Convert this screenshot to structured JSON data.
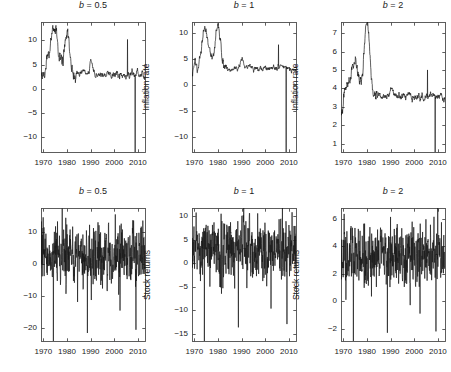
{
  "figure": {
    "background_color": "#ffffff",
    "axis_color": "#4d4d4d",
    "line_color": "#1a1a1a",
    "width": 451,
    "height": 372,
    "rows": 2,
    "cols": 3
  },
  "chart_data": [
    {
      "type": "line",
      "title": "b = 0.5",
      "title_symbol": "b",
      "title_value": "0.5",
      "xlabel": "",
      "ylabel": "Inflation rate",
      "xlim": [
        1969.0,
        2013.0
      ],
      "ylim": [
        -13.0,
        13.8
      ],
      "xticks": [
        1970,
        1980,
        1990,
        2000,
        2010
      ],
      "xtick_labels": [
        "1970",
        "1980",
        "1990",
        "2000",
        "2010"
      ],
      "yticks": [
        -10,
        -5,
        0,
        5,
        10
      ],
      "ytick_labels": [
        "−10",
        "−5",
        "0",
        "5",
        "10"
      ],
      "grid": false,
      "legend": "none",
      "seed": 11,
      "series_shape": "inflation",
      "baseline": 3.0,
      "noise": 0.85,
      "peak1": {
        "year": 1974.6,
        "height": 12.2
      },
      "peak2": {
        "year": 1980.0,
        "height": 11.9
      },
      "spike_up": {
        "year": 2005.6,
        "height": 10.2
      },
      "spike_down": {
        "year": 2008.8,
        "height": -13.0
      },
      "values_note": "monthly inflation rate series, 1969-2013"
    },
    {
      "type": "line",
      "title": "b = 1",
      "title_symbol": "b",
      "title_value": "1",
      "xlabel": "",
      "ylabel": "Inflation rate",
      "xlim": [
        1969.0,
        2013.0
      ],
      "ylim": [
        -13.0,
        12.2
      ],
      "xticks": [
        1970,
        1980,
        1990,
        2000,
        2010
      ],
      "xtick_labels": [
        "1970",
        "1980",
        "1990",
        "2000",
        "2010"
      ],
      "yticks": [
        -10,
        -5,
        0,
        5,
        10
      ],
      "ytick_labels": [
        "−10",
        "−5",
        "0",
        "5",
        "10"
      ],
      "grid": false,
      "legend": "none",
      "seed": 12,
      "series_shape": "inflation",
      "baseline": 3.2,
      "noise": 0.6,
      "peak1": {
        "year": 1974.6,
        "height": 9.9
      },
      "peak2": {
        "year": 1980.0,
        "height": 11.0
      },
      "spike_up": {
        "year": 2005.6,
        "height": 7.8
      },
      "spike_down": {
        "year": 2008.8,
        "height": -13.0
      },
      "values_note": "monthly inflation rate series, 1969-2013"
    },
    {
      "type": "line",
      "title": "b = 2",
      "title_symbol": "b",
      "title_value": "2",
      "xlabel": "",
      "ylabel": "Inflation rate",
      "xlim": [
        1969.0,
        2013.0
      ],
      "ylim": [
        0.55,
        7.6
      ],
      "xticks": [
        1970,
        1980,
        1990,
        2000,
        2010
      ],
      "xtick_labels": [
        "1970",
        "1980",
        "1990",
        "2000",
        "2010"
      ],
      "yticks": [
        1,
        2,
        3,
        4,
        5,
        6,
        7
      ],
      "ytick_labels": [
        "1",
        "2",
        "3",
        "4",
        "5",
        "6",
        "7"
      ],
      "grid": false,
      "legend": "none",
      "seed": 13,
      "series_shape": "inflation",
      "baseline": 3.55,
      "noise": 0.22,
      "peak1": {
        "year": 1974.6,
        "height": 5.3
      },
      "peak2": {
        "year": 1980.0,
        "height": 7.55
      },
      "spike_up": {
        "year": 2005.6,
        "height": 5.0
      },
      "spike_down": {
        "year": 2008.8,
        "height": 0.55
      },
      "values_note": "monthly inflation rate series, 1969-2013"
    },
    {
      "type": "line",
      "title": "b = 0.5",
      "title_symbol": "b",
      "title_value": "0.5",
      "xlabel": "",
      "ylabel": "Stock returns",
      "xlim": [
        1969.0,
        2013.0
      ],
      "ylim": [
        -24.0,
        17.5
      ],
      "xticks": [
        1970,
        1980,
        1990,
        2000,
        2010
      ],
      "xtick_labels": [
        "1970",
        "1980",
        "1990",
        "2000",
        "2010"
      ],
      "yticks": [
        -20,
        -10,
        0,
        10
      ],
      "ytick_labels": [
        "−20",
        "−10",
        "0",
        "10"
      ],
      "grid": false,
      "legend": "none",
      "seed": 21,
      "series_shape": "returns",
      "baseline": 2.6,
      "noise": 4.6,
      "crash1": {
        "year": 1974.2,
        "height": -24.0
      },
      "crash2": {
        "year": 1988.6,
        "height": -21.5
      },
      "crash3": {
        "year": 2002.4,
        "height": -14.5
      },
      "crash4": {
        "year": 2009.2,
        "height": -20.5
      },
      "values_note": "monthly stock returns series, 1969-2013"
    },
    {
      "type": "line",
      "title": "b = 1",
      "title_symbol": "b",
      "title_value": "1",
      "xlabel": "",
      "ylabel": "Stock returns",
      "xlim": [
        1969.0,
        2013.0
      ],
      "ylim": [
        -16.5,
        11.8
      ],
      "xticks": [
        1970,
        1980,
        1990,
        2000,
        2010
      ],
      "xtick_labels": [
        "1970",
        "1980",
        "1990",
        "2000",
        "2010"
      ],
      "yticks": [
        -15,
        -10,
        -5,
        0,
        5,
        10
      ],
      "ytick_labels": [
        "−15",
        "−10",
        "−5",
        "0",
        "5",
        "10"
      ],
      "grid": false,
      "legend": "none",
      "seed": 22,
      "series_shape": "returns",
      "baseline": 3.2,
      "noise": 3.1,
      "crash1": {
        "year": 1974.2,
        "height": -16.5
      },
      "crash2": {
        "year": 1988.6,
        "height": -13.6
      },
      "crash3": {
        "year": 2002.4,
        "height": -9.6
      },
      "crash4": {
        "year": 2009.2,
        "height": -12.9
      },
      "values_note": "monthly stock returns series, 1969-2013"
    },
    {
      "type": "line",
      "title": "b = 2",
      "title_symbol": "b",
      "title_value": "2",
      "xlabel": "",
      "ylabel": "Stock returns",
      "xlim": [
        1969.0,
        2013.0
      ],
      "ylim": [
        -2.9,
        6.8
      ],
      "xticks": [
        1970,
        1980,
        1990,
        2000,
        2010
      ],
      "xtick_labels": [
        "1970",
        "1980",
        "1990",
        "2000",
        "2010"
      ],
      "yticks": [
        -2,
        0,
        2,
        4,
        6
      ],
      "ytick_labels": [
        "−2",
        "0",
        "2",
        "4",
        "6"
      ],
      "grid": false,
      "legend": "none",
      "seed": 23,
      "series_shape": "returns",
      "baseline": 3.3,
      "noise": 1.05,
      "crash1": {
        "year": 1974.2,
        "height": -2.9
      },
      "crash2": {
        "year": 1988.6,
        "height": -2.3
      },
      "crash3": {
        "year": 2002.4,
        "height": -0.9
      },
      "crash4": {
        "year": 2009.2,
        "height": -2.2
      },
      "values_note": "monthly stock returns series, 1969-2013"
    }
  ]
}
